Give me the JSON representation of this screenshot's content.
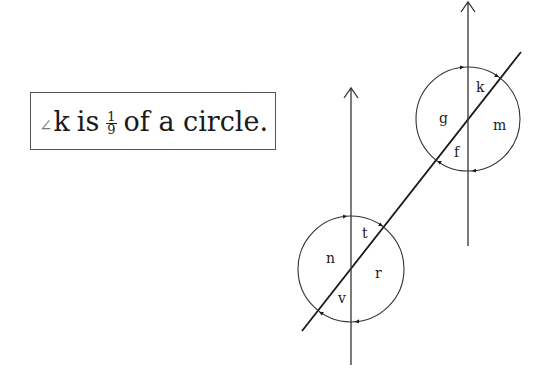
{
  "statement": {
    "angle_symbol": "∠",
    "angle_name": "k",
    "word_is": "is",
    "fraction_numerator": "1",
    "fraction_denominator": "9",
    "tail": "of a circle."
  },
  "diagram": {
    "top_figure": {
      "labels": {
        "k": "k",
        "g": "g",
        "m": "m",
        "f": "f"
      }
    },
    "bottom_figure": {
      "labels": {
        "t": "t",
        "n": "n",
        "r": "r",
        "v": "v"
      }
    },
    "colors": {
      "line": "#1a1a1a",
      "circle": "#333333"
    }
  }
}
